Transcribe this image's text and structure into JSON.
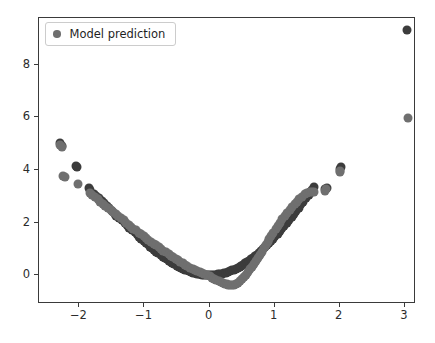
{
  "chart_data": {
    "type": "scatter",
    "title": "",
    "xlabel": "",
    "ylabel": "",
    "xlim": [
      -2.62,
      3.14
    ],
    "ylim": [
      -1.02,
      9.78
    ],
    "grid": false,
    "legend_position": "upper left",
    "xticks": [
      -2,
      -1,
      0,
      1,
      2,
      3
    ],
    "xticklabels": [
      "−2",
      "−1",
      "0",
      "1",
      "2",
      "3"
    ],
    "yticks": [
      0,
      2,
      4,
      6,
      8
    ],
    "yticklabels": [
      "0",
      "2",
      "4",
      "6",
      "8"
    ],
    "marker_size": 9,
    "series": [
      {
        "name": "Ground truth",
        "color": "#3c3c3c",
        "in_legend": false,
        "points": [
          [
            -2.3,
            5.02
          ],
          [
            -2.27,
            4.92
          ],
          [
            -2.05,
            4.17
          ],
          [
            -2.04,
            4.13
          ],
          [
            -1.85,
            3.3
          ],
          [
            -1.83,
            3.24
          ],
          [
            -1.78,
            3.08
          ],
          [
            -1.74,
            3.0
          ],
          [
            -1.7,
            2.92
          ],
          [
            -1.66,
            2.83
          ],
          [
            -1.62,
            2.74
          ],
          [
            -1.58,
            2.62
          ],
          [
            -1.55,
            2.55
          ],
          [
            -1.5,
            2.43
          ],
          [
            -1.46,
            2.33
          ],
          [
            -1.43,
            2.26
          ],
          [
            -1.39,
            2.17
          ],
          [
            -1.35,
            2.08
          ],
          [
            -1.3,
            1.97
          ],
          [
            -1.27,
            1.9
          ],
          [
            -1.23,
            1.81
          ],
          [
            -1.19,
            1.73
          ],
          [
            -1.15,
            1.63
          ],
          [
            -1.12,
            1.56
          ],
          [
            -1.08,
            1.47
          ],
          [
            -1.05,
            1.39
          ],
          [
            -1.01,
            1.31
          ],
          [
            -0.98,
            1.24
          ],
          [
            -0.95,
            1.17
          ],
          [
            -0.91,
            1.09
          ],
          [
            -0.88,
            1.02
          ],
          [
            -0.85,
            0.96
          ],
          [
            -0.82,
            0.9
          ],
          [
            -0.79,
            0.84
          ],
          [
            -0.75,
            0.77
          ],
          [
            -0.72,
            0.71
          ],
          [
            -0.69,
            0.66
          ],
          [
            -0.66,
            0.6
          ],
          [
            -0.63,
            0.55
          ],
          [
            -0.6,
            0.5
          ],
          [
            -0.57,
            0.46
          ],
          [
            -0.54,
            0.41
          ],
          [
            -0.5,
            0.36
          ],
          [
            -0.47,
            0.32
          ],
          [
            -0.44,
            0.28
          ],
          [
            -0.41,
            0.25
          ],
          [
            -0.38,
            0.21
          ],
          [
            -0.35,
            0.18
          ],
          [
            -0.32,
            0.15
          ],
          [
            -0.29,
            0.13
          ],
          [
            -0.26,
            0.1
          ],
          [
            -0.23,
            0.08
          ],
          [
            -0.2,
            0.06
          ],
          [
            -0.17,
            0.05
          ],
          [
            -0.14,
            0.03
          ],
          [
            -0.11,
            0.02
          ],
          [
            -0.08,
            0.01
          ],
          [
            -0.05,
            0.01
          ],
          [
            -0.02,
            0.0
          ],
          [
            0.01,
            0.0
          ],
          [
            0.04,
            0.01
          ],
          [
            0.07,
            0.01
          ],
          [
            0.1,
            0.02
          ],
          [
            0.13,
            0.03
          ],
          [
            0.16,
            0.04
          ],
          [
            0.19,
            0.06
          ],
          [
            0.22,
            0.08
          ],
          [
            0.25,
            0.1
          ],
          [
            0.28,
            0.12
          ],
          [
            0.31,
            0.15
          ],
          [
            0.34,
            0.18
          ],
          [
            0.37,
            0.21
          ],
          [
            0.4,
            0.24
          ],
          [
            0.43,
            0.28
          ],
          [
            0.46,
            0.32
          ],
          [
            0.49,
            0.36
          ],
          [
            0.52,
            0.4
          ],
          [
            0.55,
            0.45
          ],
          [
            0.58,
            0.5
          ],
          [
            0.61,
            0.55
          ],
          [
            0.64,
            0.6
          ],
          [
            0.67,
            0.66
          ],
          [
            0.7,
            0.72
          ],
          [
            0.73,
            0.78
          ],
          [
            0.76,
            0.85
          ],
          [
            0.79,
            0.91
          ],
          [
            0.82,
            0.98
          ],
          [
            0.85,
            1.06
          ],
          [
            0.88,
            1.13
          ],
          [
            0.91,
            1.21
          ],
          [
            0.95,
            1.31
          ],
          [
            0.98,
            1.39
          ],
          [
            1.01,
            1.48
          ],
          [
            1.05,
            1.58
          ],
          [
            1.08,
            1.67
          ],
          [
            1.12,
            1.78
          ],
          [
            1.15,
            1.88
          ],
          [
            1.19,
            1.99
          ],
          [
            1.22,
            2.09
          ],
          [
            1.26,
            2.21
          ],
          [
            1.3,
            2.33
          ],
          [
            1.33,
            2.43
          ],
          [
            1.37,
            2.56
          ],
          [
            1.41,
            2.69
          ],
          [
            1.44,
            2.79
          ],
          [
            1.48,
            2.92
          ],
          [
            1.52,
            3.05
          ],
          [
            1.55,
            3.15
          ],
          [
            1.58,
            3.24
          ],
          [
            1.61,
            3.34
          ],
          [
            1.78,
            3.28
          ],
          [
            1.8,
            3.33
          ],
          [
            2.01,
            4.05
          ],
          [
            2.02,
            4.12
          ],
          [
            3.04,
            9.32
          ]
        ]
      },
      {
        "name": "Model prediction",
        "color": "#6f6f6f",
        "in_legend": true,
        "points": [
          [
            -2.3,
            4.96
          ],
          [
            -2.26,
            4.88
          ],
          [
            -2.25,
            3.77
          ],
          [
            -2.22,
            3.72
          ],
          [
            -2.02,
            3.48
          ],
          [
            -1.84,
            3.14
          ],
          [
            -1.8,
            3.06
          ],
          [
            -1.76,
            2.98
          ],
          [
            -1.72,
            2.9
          ],
          [
            -1.68,
            2.8
          ],
          [
            -1.64,
            2.72
          ],
          [
            -1.6,
            2.64
          ],
          [
            -1.56,
            2.56
          ],
          [
            -1.52,
            2.48
          ],
          [
            -1.48,
            2.4
          ],
          [
            -1.44,
            2.32
          ],
          [
            -1.4,
            2.24
          ],
          [
            -1.36,
            2.16
          ],
          [
            -1.32,
            2.08
          ],
          [
            -1.28,
            2.0
          ],
          [
            -1.24,
            1.92
          ],
          [
            -1.2,
            1.84
          ],
          [
            -1.17,
            1.77
          ],
          [
            -1.13,
            1.7
          ],
          [
            -1.09,
            1.62
          ],
          [
            -1.05,
            1.55
          ],
          [
            -1.01,
            1.48
          ],
          [
            -0.97,
            1.4
          ],
          [
            -0.94,
            1.33
          ],
          [
            -0.9,
            1.27
          ],
          [
            -0.86,
            1.2
          ],
          [
            -0.82,
            1.13
          ],
          [
            -0.78,
            1.06
          ],
          [
            -0.75,
            1.0
          ],
          [
            -0.71,
            0.93
          ],
          [
            -0.67,
            0.87
          ],
          [
            -0.63,
            0.8
          ],
          [
            -0.6,
            0.74
          ],
          [
            -0.56,
            0.68
          ],
          [
            -0.52,
            0.62
          ],
          [
            -0.48,
            0.56
          ],
          [
            -0.45,
            0.5
          ],
          [
            -0.41,
            0.45
          ],
          [
            -0.37,
            0.39
          ],
          [
            -0.34,
            0.34
          ],
          [
            -0.3,
            0.29
          ],
          [
            -0.26,
            0.24
          ],
          [
            -0.22,
            0.19
          ],
          [
            -0.19,
            0.15
          ],
          [
            -0.15,
            0.11
          ],
          [
            -0.11,
            0.07
          ],
          [
            -0.08,
            0.03
          ],
          [
            -0.04,
            -0.01
          ],
          [
            0.0,
            -0.05
          ],
          [
            0.03,
            -0.09
          ],
          [
            0.07,
            -0.13
          ],
          [
            0.1,
            -0.17
          ],
          [
            0.14,
            -0.21
          ],
          [
            0.17,
            -0.25
          ],
          [
            0.2,
            -0.29
          ],
          [
            0.23,
            -0.32
          ],
          [
            0.26,
            -0.35
          ],
          [
            0.29,
            -0.37
          ],
          [
            0.32,
            -0.38
          ],
          [
            0.35,
            -0.38
          ],
          [
            0.38,
            -0.36
          ],
          [
            0.41,
            -0.33
          ],
          [
            0.44,
            -0.28
          ],
          [
            0.47,
            -0.22
          ],
          [
            0.5,
            -0.15
          ],
          [
            0.53,
            -0.07
          ],
          [
            0.56,
            0.02
          ],
          [
            0.59,
            0.12
          ],
          [
            0.62,
            0.22
          ],
          [
            0.65,
            0.33
          ],
          [
            0.68,
            0.44
          ],
          [
            0.71,
            0.55
          ],
          [
            0.74,
            0.66
          ],
          [
            0.77,
            0.78
          ],
          [
            0.8,
            0.9
          ],
          [
            0.83,
            1.02
          ],
          [
            0.86,
            1.14
          ],
          [
            0.89,
            1.26
          ],
          [
            0.92,
            1.38
          ],
          [
            0.95,
            1.5
          ],
          [
            0.98,
            1.62
          ],
          [
            1.02,
            1.76
          ],
          [
            1.05,
            1.88
          ],
          [
            1.08,
            1.99
          ],
          [
            1.12,
            2.13
          ],
          [
            1.16,
            2.26
          ],
          [
            1.19,
            2.36
          ],
          [
            1.23,
            2.48
          ],
          [
            1.27,
            2.6
          ],
          [
            1.31,
            2.71
          ],
          [
            1.34,
            2.8
          ],
          [
            1.38,
            2.9
          ],
          [
            1.42,
            2.99
          ],
          [
            1.46,
            3.07
          ],
          [
            1.5,
            3.13
          ],
          [
            1.54,
            3.17
          ],
          [
            1.57,
            3.18
          ],
          [
            1.6,
            3.17
          ],
          [
            1.77,
            3.22
          ],
          [
            1.79,
            3.26
          ],
          [
            2.0,
            3.93
          ],
          [
            2.01,
            3.98
          ],
          [
            3.05,
            5.99
          ]
        ]
      }
    ]
  },
  "legend": {
    "label": "Model prediction",
    "marker_color": "#6f6f6f"
  }
}
